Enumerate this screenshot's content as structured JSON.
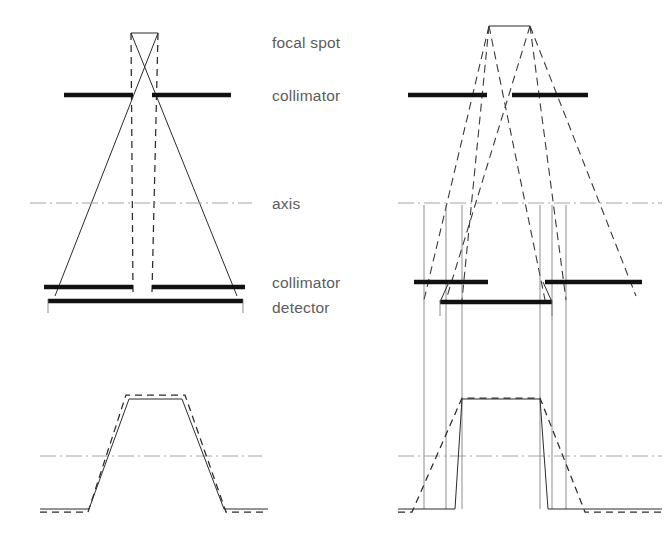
{
  "figure": {
    "title_visible": false,
    "background": "#ffffff",
    "ink_color": "#2b2b2b",
    "bar_color": "#111111",
    "axis_color": "#9a9a9a",
    "label_color": "#5c5c5c"
  },
  "labels": {
    "focal_spot": "focal spot",
    "collimator_top": "collimator",
    "axis": "axis",
    "collimator_bottom": "collimator",
    "detector": "detector"
  },
  "label_positions": {
    "focal_spot": {
      "x": 272,
      "y": 48
    },
    "collimator_top": {
      "x": 272,
      "y": 101
    },
    "axis": {
      "x": 272,
      "y": 209
    },
    "collimator_bottom": {
      "x": 272,
      "y": 288
    },
    "detector": {
      "x": 272,
      "y": 312
    }
  },
  "geometry": {
    "left_panel": {
      "focal_spot": {
        "x1": 131,
        "x2": 158,
        "y": 33
      },
      "top_collimator": {
        "y": 95,
        "left": [
          64,
          133
        ],
        "right": [
          152,
          231
        ]
      },
      "bottom_collimator": {
        "y": 287,
        "left": [
          44,
          133
        ],
        "right": [
          152,
          245
        ]
      },
      "detector_bar": {
        "y": 301,
        "x1": 48,
        "x2": 243
      },
      "axis_y": 203,
      "axis_x": [
        30,
        252
      ],
      "solid_rays": [
        {
          "x1": 158,
          "y1": 33,
          "x2": 55,
          "y2": 296
        },
        {
          "x1": 131,
          "y1": 33,
          "x2": 237,
          "y2": 296
        }
      ],
      "dashed_rays": [
        {
          "x1": 131,
          "y1": 33,
          "x2": 133,
          "y2": 292
        },
        {
          "x1": 158,
          "y1": 33,
          "x2": 152,
          "y2": 292
        }
      ],
      "detector_ticks": [
        {
          "x": 48,
          "y1": 299,
          "y2": 312
        },
        {
          "x": 243,
          "y1": 299,
          "y2": 312
        }
      ],
      "profile": {
        "axis_y": 456,
        "axis_x": [
          40,
          262
        ],
        "baseline_y": 509,
        "top_y": 398,
        "solid_points": [
          [
            40,
            509
          ],
          [
            89,
            509
          ],
          [
            129,
            399
          ],
          [
            182,
            399
          ],
          [
            224,
            509
          ],
          [
            268,
            509
          ]
        ],
        "dashed_points": [
          [
            40,
            512
          ],
          [
            88,
            512
          ],
          [
            126,
            395
          ],
          [
            185,
            395
          ],
          [
            226,
            512
          ],
          [
            268,
            512
          ]
        ]
      }
    },
    "right_panel": {
      "focal_spot": {
        "x1": 489,
        "x2": 530,
        "y": 26
      },
      "top_collimator": {
        "y": 95,
        "left": [
          408,
          487
        ],
        "right": [
          512,
          588
        ]
      },
      "bottom_collimator": {
        "y": 282,
        "left": [
          414,
          488
        ],
        "right": [
          545,
          640
        ]
      },
      "detector_bar": {
        "y": 302,
        "x1": 440,
        "x2": 552
      },
      "axis_y": 203,
      "axis_x": [
        398,
        660
      ],
      "dashed_rays": [
        {
          "x1": 489,
          "y1": 26,
          "x2": 424,
          "y2": 296
        },
        {
          "x1": 489,
          "y1": 26,
          "x2": 540,
          "y2": 296
        },
        {
          "x1": 530,
          "y1": 26,
          "x2": 446,
          "y2": 296
        },
        {
          "x1": 530,
          "y1": 26,
          "x2": 636,
          "y2": 296
        },
        {
          "x1": 489,
          "y1": 26,
          "x2": 462,
          "y2": 296
        },
        {
          "x1": 530,
          "y1": 26,
          "x2": 566,
          "y2": 296
        }
      ],
      "verticals": [
        {
          "x": 424,
          "y1": 208,
          "y2": 509
        },
        {
          "x": 446,
          "y1": 208,
          "y2": 509
        },
        {
          "x": 462,
          "y1": 208,
          "y2": 509
        },
        {
          "x": 540,
          "y1": 208,
          "y2": 509
        },
        {
          "x": 552,
          "y1": 208,
          "y2": 509
        },
        {
          "x": 566,
          "y1": 208,
          "y2": 509
        }
      ],
      "detector_ticks": [
        {
          "x": 440,
          "y1": 300,
          "y2": 316
        },
        {
          "x": 552,
          "y1": 300,
          "y2": 316
        }
      ],
      "profile": {
        "axis_y": 456,
        "axis_x": [
          398,
          660
        ],
        "baseline_y": 509,
        "top_y": 398,
        "solid_points": [
          [
            398,
            509
          ],
          [
            455,
            509
          ],
          [
            462,
            399
          ],
          [
            540,
            399
          ],
          [
            548,
            509
          ],
          [
            660,
            509
          ]
        ],
        "dashed_points": [
          [
            398,
            512
          ],
          [
            412,
            512
          ],
          [
            462,
            398
          ],
          [
            540,
            398
          ],
          [
            585,
            512
          ],
          [
            660,
            512
          ]
        ]
      }
    }
  },
  "icons": {
    "focal_spot_marker": "line-segment-icon",
    "collimator_bar": "thick-bar-icon",
    "axis_marker": "dash-dot-axis-icon"
  }
}
